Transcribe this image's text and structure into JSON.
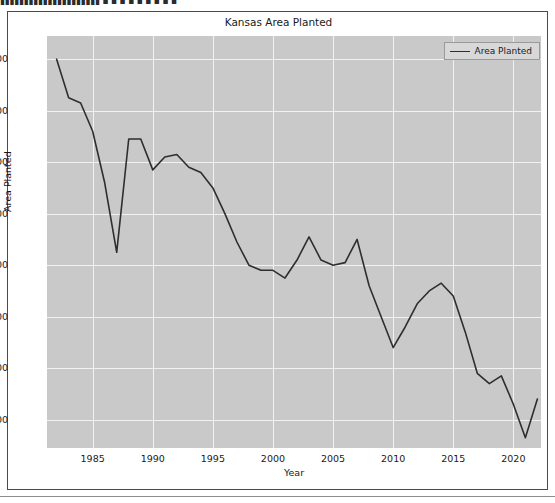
{
  "top_strip": {
    "text": "▮▮▮▮▮▮▮▮▮▮▮▮▮▮▮▮▮▮▮▮▮ ▪ ▪ ▪ ▪ ▪ ▪ ▪       ▪                        ▪"
  },
  "figure": {
    "title": "Kansas  Area Planted",
    "legend": {
      "entries": [
        {
          "label": "Area Planted",
          "color": "#2e2e2e"
        }
      ],
      "position": "upper right"
    },
    "background_color": "#c9c9c9",
    "grid_color": "#f2f2f2",
    "line_color": "#2e2e2e"
  },
  "chart_data": {
    "type": "line",
    "title": "Kansas  Area Planted",
    "xlabel": "Year",
    "ylabel": "Area Planted",
    "xlim": [
      1981.2,
      2022.3
    ],
    "ylim": [
      6450,
      14450
    ],
    "grid": true,
    "legend": [
      "Area Planted"
    ],
    "xticks": [
      1985,
      1990,
      1995,
      2000,
      2005,
      2010,
      2015,
      2020
    ],
    "yticks": [
      7000,
      8000,
      9000,
      10000,
      11000,
      12000,
      13000,
      14000
    ],
    "x": [
      1982,
      1983,
      1984,
      1985,
      1986,
      1987,
      1988,
      1989,
      1990,
      1991,
      1992,
      1993,
      1994,
      1995,
      1996,
      1997,
      1998,
      1999,
      2000,
      2001,
      2002,
      2003,
      2004,
      2005,
      2006,
      2007,
      2008,
      2009,
      2010,
      2011,
      2012,
      2013,
      2014,
      2015,
      2016,
      2017,
      2018,
      2019,
      2020,
      2021,
      2022
    ],
    "series": [
      {
        "name": "Area Planted",
        "color": "#2e2e2e",
        "values": [
          14000,
          13250,
          13150,
          12600,
          11600,
          10250,
          12450,
          12450,
          11850,
          12100,
          12150,
          11900,
          11800,
          11500,
          11000,
          10450,
          10000,
          9900,
          9900,
          9750,
          10100,
          10550,
          10100,
          10000,
          10050,
          10500,
          9600,
          9000,
          8400,
          8800,
          9250,
          9500,
          9650,
          9400,
          8700,
          7900,
          7700,
          7850,
          7300,
          6650,
          7400
        ]
      }
    ]
  }
}
